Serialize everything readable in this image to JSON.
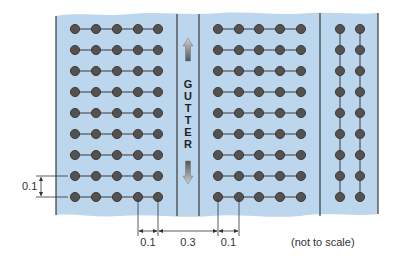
{
  "diagram": {
    "gutter_label": "GUTTER",
    "gutter_letters": [
      "G",
      "U",
      "T",
      "T",
      "E",
      "R"
    ],
    "note": "(not to scale)",
    "dimensions": {
      "row_spacing": "0.1",
      "column_spacing_left": "0.1",
      "gutter_width": "0.3",
      "column_spacing_right": "0.1"
    },
    "sections": [
      {
        "name": "left-block",
        "columns": 5,
        "rows": 9,
        "connection": "horizontal"
      },
      {
        "name": "middle-block",
        "columns": 5,
        "rows": 9,
        "connection": "horizontal"
      },
      {
        "name": "right-block",
        "columns": 2,
        "rows": 9,
        "connection": "vertical"
      }
    ],
    "colors": {
      "board": "#bcd6ee",
      "dot_fill": "#55514f",
      "dot_stroke": "#2e2b2a",
      "line": "#3a3a3a",
      "text": "#333333"
    }
  }
}
